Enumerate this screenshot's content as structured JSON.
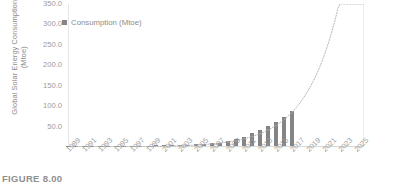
{
  "figure": {
    "caption": "FIGURE 8.00"
  },
  "chart_data": {
    "type": "bar",
    "title": "",
    "xlabel": "",
    "ylabel": "Global Solar Energy Consumption (Mtoe)",
    "ylabel_lines": [
      "Global Solar Energy Consumption",
      "(Mtoe)"
    ],
    "ylim": [
      0,
      350
    ],
    "y_ticks": [
      350.0,
      300.0,
      250.0,
      200.0,
      150.0,
      100.0,
      50.0
    ],
    "y_tick_labels": [
      "350.0",
      "300.0",
      "250.0",
      "200.0",
      "150.0",
      "100.0",
      "50.0"
    ],
    "x_tick_labels": [
      "1989",
      "1991",
      "1993",
      "1995",
      "1997",
      "1999",
      "2001",
      "2003",
      "2005",
      "2007",
      "2009",
      "2011",
      "2013",
      "2015",
      "2017",
      "2019",
      "2021",
      "2023",
      "2025"
    ],
    "xlim": [
      1989,
      2026
    ],
    "grid": false,
    "legend_position": "top-left",
    "legend": [
      {
        "name": "Consumption (Mtoe)",
        "color": "#848484",
        "marker": "square"
      }
    ],
    "series": [
      {
        "name": "Consumption (Mtoe)",
        "color": "#848484",
        "x": [
          1989,
          1990,
          1991,
          1992,
          1993,
          1994,
          1995,
          1996,
          1997,
          1998,
          1999,
          2000,
          2001,
          2002,
          2003,
          2004,
          2005,
          2006,
          2007,
          2008,
          2009,
          2010,
          2011,
          2012,
          2013,
          2014,
          2015,
          2016,
          2017
        ],
        "values": [
          0.1,
          0.2,
          0.2,
          0.3,
          0.3,
          0.4,
          0.5,
          0.6,
          0.7,
          0.9,
          1.1,
          1.3,
          1.6,
          1.9,
          2.4,
          3.0,
          3.8,
          4.9,
          6.4,
          8.5,
          11.5,
          16.0,
          23.0,
          31.0,
          40.0,
          50.0,
          60.0,
          72.0,
          85.0
        ]
      }
    ],
    "trendline": {
      "type": "exponential",
      "style": "dotted",
      "color": "#b5b5b5",
      "extends_to": 2026,
      "end_value": 350.0
    }
  }
}
